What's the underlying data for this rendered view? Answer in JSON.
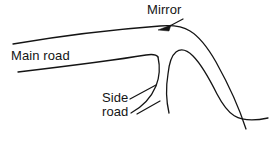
{
  "diagram": {
    "background_color": "#ffffff",
    "ink_color": "#141414",
    "labels": {
      "mirror": "Mirror",
      "main_road": "Main road",
      "side_road_line1": "Side",
      "side_road_line2": "road"
    },
    "icons": {
      "mirror_pointer": "arrow-icon",
      "side_road_leader_upper": "leader-line-icon",
      "side_road_leader_lower": "leader-line-icon"
    },
    "elements": [
      "main-road-upper-edge",
      "main-road-lower-edge",
      "side-road-left-edge",
      "side-road-right-edge",
      "traffic-island-edge"
    ]
  }
}
